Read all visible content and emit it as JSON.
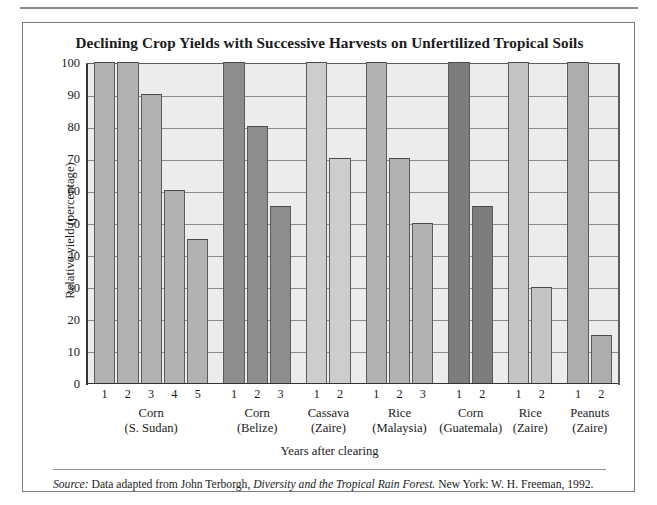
{
  "figure": {
    "title": "Declining Crop Yields with Successive Harvests on Unfertilized Tropical Soils",
    "source_prefix": "Source:",
    "source_text_1": " Data adapted from John Terborgh, ",
    "source_italic": "Diversity and the Tropical Rain Forest.",
    "source_text_2": " New York: W. H. Freeman, 1992."
  },
  "chart_data": {
    "type": "bar",
    "title": "Declining Crop Yields with Successive Harvests on Unfertilized Tropical Soils",
    "xlabel": "Years after clearing",
    "ylabel": "Relative yield (percentage)",
    "ylim": [
      0,
      100
    ],
    "yticks": [
      0,
      10,
      20,
      30,
      40,
      50,
      60,
      70,
      80,
      90,
      100
    ],
    "ytick_labels": [
      "0",
      "10",
      "20",
      "30",
      "40",
      "50",
      "60",
      "70",
      "80",
      "90",
      "100"
    ],
    "grid": "horizontal",
    "legend": "none",
    "plot_background": "#ececec",
    "groups": [
      {
        "crop": "Corn",
        "location": "(S. Sudan)",
        "color": "#b2b2b2",
        "x": [
          "1",
          "2",
          "3",
          "4",
          "5"
        ],
        "values": [
          100,
          100,
          90,
          60,
          45
        ]
      },
      {
        "crop": "Corn",
        "location": "(Belize)",
        "color": "#8d8d8d",
        "x": [
          "1",
          "2",
          "3"
        ],
        "values": [
          100,
          80,
          55
        ]
      },
      {
        "crop": "Cassava",
        "location": "(Zaire)",
        "color": "#cdcdcd",
        "x": [
          "1",
          "2"
        ],
        "values": [
          100,
          70
        ]
      },
      {
        "crop": "Rice",
        "location": "(Malaysia)",
        "color": "#b2b2b2",
        "x": [
          "1",
          "2",
          "3"
        ],
        "values": [
          100,
          70,
          50
        ]
      },
      {
        "crop": "Corn",
        "location": "(Guatemala)",
        "color": "#7d7d7d",
        "x": [
          "1",
          "2"
        ],
        "values": [
          100,
          55
        ]
      },
      {
        "crop": "Rice",
        "location": "(Zaire)",
        "color": "#c4c4c4",
        "x": [
          "1",
          "2"
        ],
        "values": [
          100,
          30
        ]
      },
      {
        "crop": "Peanuts",
        "location": "(Zaire)",
        "color": "#adadad",
        "x": [
          "1",
          "2"
        ],
        "values": [
          100,
          15
        ]
      }
    ]
  }
}
